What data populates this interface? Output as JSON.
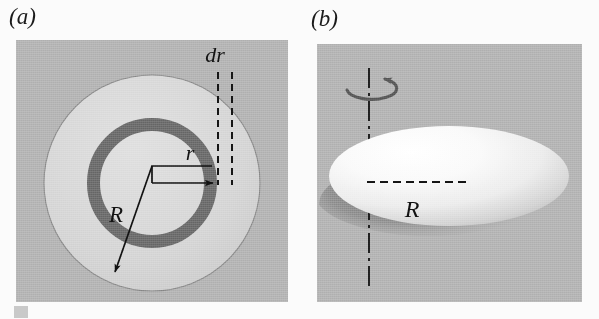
{
  "figure": {
    "domain_kind": "diagram",
    "background_color": "#fbfbfb",
    "panel_background_color": "#b5b5b5",
    "disk_light_color": "#d8d8d8",
    "annulus_dark_color": "#6e6e6e",
    "ink_color": "#121212"
  },
  "panels": [
    {
      "id": "panel-a",
      "label": "(a)",
      "caption_style": "italic-serif",
      "view": "top-down view of a rotating disk with a differential annular ring",
      "geometry": {
        "disk_center": [
          152,
          183
        ],
        "disk_outer_radius": 108,
        "ring_inner_radius": 52,
        "ring_outer_radius": 65
      },
      "annotations": [
        {
          "name": "dr-label",
          "text": "dr",
          "kind": "dimension-label",
          "position": [
            216,
            40
          ],
          "description": "width of the differential annular ring"
        },
        {
          "name": "r-label",
          "text": "r",
          "kind": "radius-label",
          "position": [
            190,
            155
          ],
          "description": "radius to the inner edge of the differential ring"
        },
        {
          "name": "R-label",
          "text": "R",
          "kind": "radius-label",
          "position": [
            116,
            215
          ],
          "description": "outer radius of the full disk"
        }
      ],
      "leaders": [
        {
          "name": "dr-dashed-line-left",
          "kind": "dashed-vertical",
          "x": 218,
          "y_top": 72,
          "y_bottom": 185
        },
        {
          "name": "dr-dashed-line-right",
          "kind": "dashed-vertical",
          "x": 232,
          "y_top": 72,
          "y_bottom": 185
        },
        {
          "name": "r-arrow",
          "kind": "arrow",
          "from": [
            152,
            183
          ],
          "to": [
            218,
            183
          ],
          "elbow": [
            152,
            166
          ]
        },
        {
          "name": "R-arrow",
          "kind": "arrow",
          "from": [
            152,
            166
          ],
          "to": [
            113,
            276
          ]
        }
      ]
    },
    {
      "id": "panel-b",
      "label": "(b)",
      "caption_style": "italic-serif",
      "view": "oblique 3D view of the disk spinning about its vertical symmetry axis",
      "geometry": {
        "disk_center": [
          449,
          176
        ],
        "disk_semi_major_axis": 120,
        "disk_semi_minor_axis": 50,
        "rotation_axis_x": 369,
        "rotation_axis_top": 68,
        "rotation_axis_bottom": 288
      },
      "annotations": [
        {
          "name": "R-label",
          "text": "R",
          "kind": "radius-label",
          "position": [
            411,
            209
          ],
          "description": "disk radius measured from the rotation axis"
        }
      ],
      "leaders": [
        {
          "name": "rotation-axis-line",
          "kind": "dash-dot-vertical",
          "x": 369,
          "y_top": 68,
          "y_bottom": 288
        },
        {
          "name": "radius-dashed-line",
          "kind": "dashed-horizontal",
          "from": [
            369,
            182
          ],
          "to": [
            466,
            182
          ]
        },
        {
          "name": "rotation-arrow",
          "kind": "curved-arrow-ellipse",
          "center": [
            369,
            86
          ],
          "rx": 25,
          "ry": 11,
          "direction": "counterclockwise-viewed-from-above"
        }
      ]
    }
  ]
}
